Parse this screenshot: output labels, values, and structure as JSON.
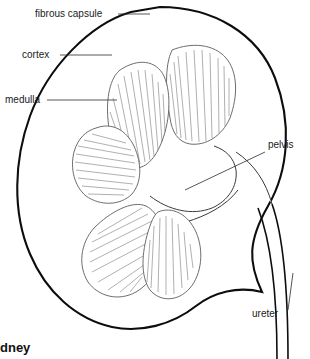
{
  "figure": {
    "caption": "dney",
    "caption_note": "bold caption clipped at left edge of image",
    "background_color": "#ffffff",
    "ink_color": "#0d0d0d",
    "capsule_color": "#0d0d0d",
    "stipple_color": "#555555",
    "striation_color": "#6e6e6e"
  },
  "labels": [
    {
      "id": "fibrous-capsule",
      "text": "fibrous capsule",
      "x": 35,
      "y": 17,
      "leader_from_x": 118,
      "leader_from_y": 14,
      "leader_to_x": 150,
      "leader_to_y": 14
    },
    {
      "id": "cortex",
      "text": "cortex",
      "x": 22,
      "y": 58,
      "leader_from_x": 60,
      "leader_from_y": 55,
      "leader_to_x": 112,
      "leader_to_y": 55
    },
    {
      "id": "medulla",
      "text": "medulla",
      "x": 5,
      "y": 103,
      "leader_from_x": 47,
      "leader_from_y": 100,
      "leader_to_x": 117,
      "leader_to_y": 100
    },
    {
      "id": "pelvis",
      "text": "pelvis",
      "x": 268,
      "y": 148,
      "leader_from_x": 265,
      "leader_from_y": 152,
      "leader_to_x": 185,
      "leader_to_y": 190
    },
    {
      "id": "ureter",
      "text": "ureter",
      "x": 252,
      "y": 317,
      "leader_from_x": 288,
      "leader_from_y": 310,
      "leader_to_x": 293,
      "leader_to_y": 273
    }
  ],
  "structures": [
    {
      "id": "fibrous-capsule",
      "kind": "outline",
      "description": "thick dark bean-shaped outer border"
    },
    {
      "id": "cortex",
      "kind": "region",
      "description": "stippled outer zone between capsule and pyramids"
    },
    {
      "id": "medullary-pyramid-upper-right",
      "kind": "pyramid",
      "description": "fan of radiating striations, apex toward pelvis"
    },
    {
      "id": "medullary-pyramid-upper-left",
      "kind": "pyramid",
      "description": "fan of radiating striations, apex toward pelvis"
    },
    {
      "id": "medullary-pyramid-mid-left",
      "kind": "pyramid",
      "description": "fan of radiating striations, apex toward pelvis"
    },
    {
      "id": "medullary-pyramid-lower-left",
      "kind": "pyramid",
      "description": "fan of radiating striations, apex toward pelvis"
    },
    {
      "id": "medullary-pyramid-lower-right",
      "kind": "pyramid",
      "description": "fan of radiating striations, apex toward pelvis"
    },
    {
      "id": "renal-pelvis",
      "kind": "cavity",
      "description": "white funnel cavity at hilum collecting from pyramids"
    },
    {
      "id": "ureter",
      "kind": "tube",
      "description": "narrow two-line tube descending from pelvis off bottom right"
    }
  ],
  "pyramid_count": 5
}
